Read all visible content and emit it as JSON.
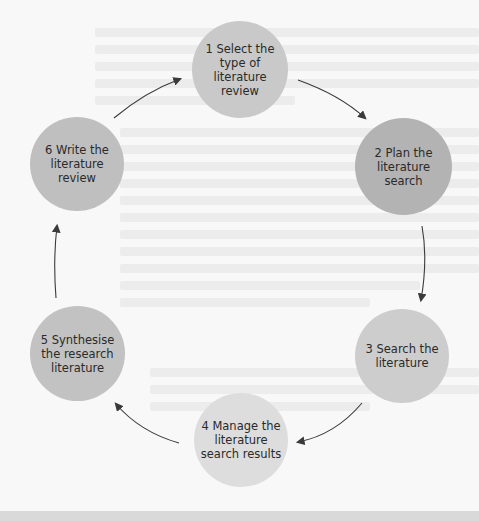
{
  "diagram": {
    "type": "cycle",
    "steps": [
      {
        "number": "1",
        "label": "1  Select the\ntype of\nliterature\nreview",
        "color": "#c9c9c9"
      },
      {
        "number": "2",
        "label": "2  Plan the\nliterature\nsearch",
        "color": "#b3b3b3"
      },
      {
        "number": "3",
        "label": "3  Search the\nliterature",
        "color": "#cdcdcd"
      },
      {
        "number": "4",
        "label": "4  Manage the\nliterature\nsearch results",
        "color": "#dddddd"
      },
      {
        "number": "5",
        "label": "5  Synthesise\nthe research\nliterature",
        "color": "#c2c2c2"
      },
      {
        "number": "6",
        "label": "6  Write the\nliterature\nreview",
        "color": "#bfbfbf"
      }
    ],
    "arrow_color": "#3a3a3a",
    "background": "#f8f8f8"
  }
}
